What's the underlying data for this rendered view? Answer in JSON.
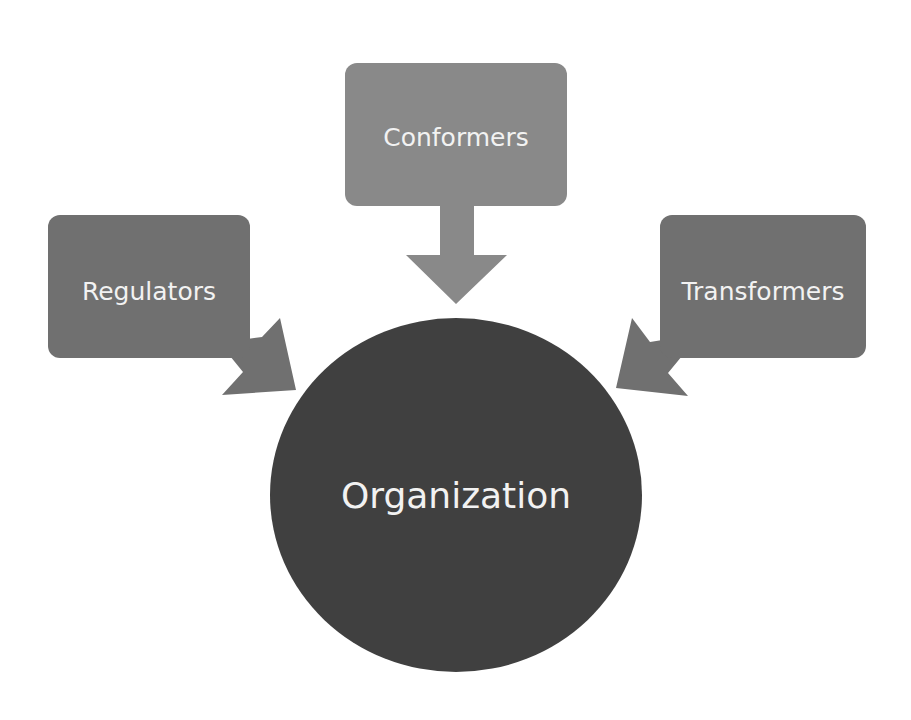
{
  "diagram": {
    "center": {
      "label": "Organization",
      "color": "#404040"
    },
    "nodes": [
      {
        "id": "conformers",
        "label": "Conformers",
        "color": "#898989",
        "position": "top"
      },
      {
        "id": "regulators",
        "label": "Regulators",
        "color": "#707070",
        "position": "left"
      },
      {
        "id": "transformers",
        "label": "Transformers",
        "color": "#707070",
        "position": "right"
      }
    ],
    "edges": [
      {
        "from": "conformers",
        "to": "organization"
      },
      {
        "from": "regulators",
        "to": "organization"
      },
      {
        "from": "transformers",
        "to": "organization"
      }
    ]
  }
}
